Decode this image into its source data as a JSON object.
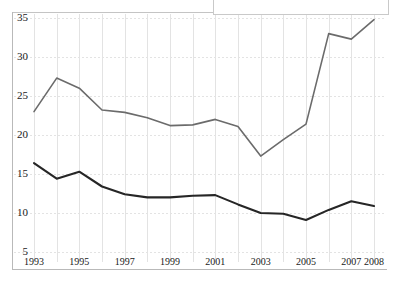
{
  "chart_data": {
    "type": "line",
    "title": "",
    "xlabel": "",
    "ylabel": "",
    "x": [
      1993,
      1994,
      1995,
      1996,
      1997,
      1998,
      1999,
      2000,
      2001,
      2002,
      2003,
      2004,
      2005,
      2006,
      2007,
      2008
    ],
    "xlim": [
      1993,
      2008
    ],
    "ylim": [
      5,
      35
    ],
    "grid": true,
    "legend": "none",
    "y_ticks": [
      5,
      10,
      15,
      20,
      25,
      30,
      35
    ],
    "y_tick_labels": [
      "5",
      "10",
      "15",
      "20",
      "25",
      "30",
      "35"
    ],
    "x_tick_labels": [
      "1993",
      "1995",
      "1997",
      "1999",
      "2001",
      "2003",
      "2005",
      "2007",
      "2008"
    ],
    "x_tick_values": [
      1993,
      1995,
      1997,
      1999,
      2001,
      2003,
      2005,
      2007,
      2008
    ],
    "series": [
      {
        "name": "upper-series",
        "color": "#6b6b6b",
        "width": 1.6,
        "values": [
          23.0,
          27.3,
          26.0,
          23.2,
          22.9,
          22.2,
          21.2,
          21.3,
          22.0,
          21.1,
          17.3,
          19.4,
          21.4,
          33.0,
          32.3,
          34.8
        ]
      },
      {
        "name": "lower-series",
        "color": "#262626",
        "width": 2.1,
        "values": [
          16.4,
          14.4,
          15.3,
          13.4,
          12.4,
          12.0,
          12.0,
          12.2,
          12.3,
          11.1,
          10.0,
          9.9,
          9.1,
          10.4,
          11.5,
          10.9
        ]
      }
    ]
  },
  "axes": {
    "gridline_color": "#e3e3e3",
    "axis_color": "#b9b9b9",
    "background": "#ffffff"
  },
  "overlay": {
    "note": "",
    "present": true
  }
}
